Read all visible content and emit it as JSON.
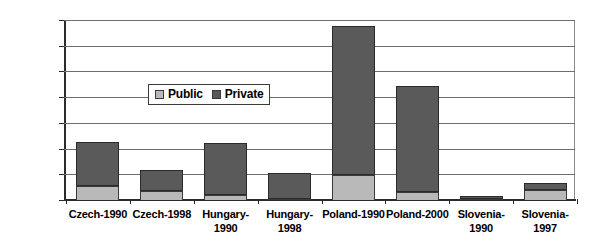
{
  "chart_data": {
    "type": "bar",
    "title": "",
    "xlabel": "",
    "ylabel": "",
    "ylim": [
      0,
      140000
    ],
    "ytick_step": 20000,
    "yticks": [
      "0",
      "20000",
      "40000",
      "60000",
      "80000",
      "100000",
      "120000",
      "140000"
    ],
    "grid": true,
    "stacked": true,
    "legend_position": "inside-upper-left",
    "categories": [
      "Czech-1990",
      "Czech-1998",
      "Hungary-1990",
      "Hungary-1998",
      "Poland-1990",
      "Poland-2000",
      "Slovenia-1990",
      "Slovenia-1997"
    ],
    "series": [
      {
        "name": "Public",
        "color": "#b9b9b9",
        "values": [
          11000,
          7000,
          4000,
          500,
          19500,
          6000,
          800,
          8000
        ]
      },
      {
        "name": "Private",
        "color": "#5a5a5a",
        "values": [
          34000,
          16500,
          40000,
          20500,
          115500,
          83000,
          2700,
          5500
        ]
      }
    ],
    "totals": [
      45000,
      23500,
      44000,
      21000,
      135000,
      89000,
      3500,
      13500
    ]
  },
  "legend": {
    "items": [
      {
        "label": "Public",
        "swatch": "public"
      },
      {
        "label": "Private",
        "swatch": "private"
      }
    ]
  }
}
